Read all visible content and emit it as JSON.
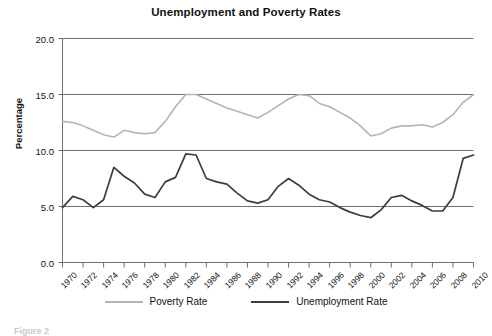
{
  "chart_data": {
    "type": "line",
    "title": "Unemployment and Poverty Rates",
    "xlabel": "",
    "ylabel": "Percentage",
    "ylim": [
      0.0,
      20.0
    ],
    "xlim": [
      1970,
      2010
    ],
    "grid": true,
    "legend_position": "bottom",
    "ytick_labels": [
      "20.0",
      "15.0",
      "10.0",
      "5.0",
      "0.0"
    ],
    "ytick_values": [
      20.0,
      15.0,
      10.0,
      5.0,
      0.0
    ],
    "xtick_labels": [
      "1970",
      "1972",
      "1974",
      "1976",
      "1978",
      "1980",
      "1982",
      "1984",
      "1986",
      "1988",
      "1990",
      "1992",
      "1994",
      "1996",
      "1998",
      "2000",
      "2002",
      "2004",
      "2006",
      "2008",
      "2010"
    ],
    "xtick_values": [
      1970,
      1972,
      1974,
      1976,
      1978,
      1980,
      1982,
      1984,
      1986,
      1988,
      1990,
      1992,
      1994,
      1996,
      1998,
      2000,
      2002,
      2004,
      2006,
      2008,
      2010
    ],
    "x": [
      1970,
      1971,
      1972,
      1973,
      1974,
      1975,
      1976,
      1977,
      1978,
      1979,
      1980,
      1981,
      1982,
      1983,
      1984,
      1985,
      1986,
      1987,
      1988,
      1989,
      1990,
      1991,
      1992,
      1993,
      1994,
      1995,
      1996,
      1997,
      1998,
      1999,
      2000,
      2001,
      2002,
      2003,
      2004,
      2005,
      2006,
      2007,
      2008,
      2009,
      2010
    ],
    "series": [
      {
        "name": "Poverty Rate",
        "color": "#b4b4b4",
        "values": [
          12.6,
          12.5,
          12.2,
          11.8,
          11.4,
          11.2,
          11.8,
          11.6,
          11.5,
          11.6,
          12.6,
          13.9,
          15.0,
          15.0,
          14.6,
          14.2,
          13.8,
          13.5,
          13.2,
          12.9,
          13.4,
          14.0,
          14.6,
          15.0,
          14.9,
          14.2,
          13.9,
          13.4,
          12.9,
          12.2,
          11.3,
          11.5,
          12.0,
          12.2,
          12.2,
          12.3,
          12.1,
          12.5,
          13.2,
          14.3,
          15.0
        ]
      },
      {
        "name": "Unemployment Rate",
        "color": "#3d3d3d",
        "values": [
          4.9,
          5.9,
          5.6,
          4.9,
          5.6,
          8.5,
          7.7,
          7.1,
          6.1,
          5.8,
          7.2,
          7.6,
          9.7,
          9.6,
          7.5,
          7.2,
          7.0,
          6.2,
          5.5,
          5.3,
          5.6,
          6.8,
          7.5,
          6.9,
          6.1,
          5.6,
          5.4,
          4.9,
          4.5,
          4.2,
          4.0,
          4.7,
          5.8,
          6.0,
          5.5,
          5.1,
          4.6,
          4.6,
          5.8,
          9.3,
          9.6
        ]
      }
    ]
  },
  "legend": {
    "entries": [
      {
        "label": "Poverty Rate"
      },
      {
        "label": "Unemployment Rate"
      }
    ]
  },
  "caption": "Figure 2"
}
